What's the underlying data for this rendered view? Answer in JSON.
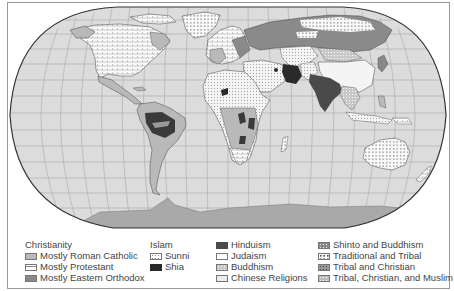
{
  "map": {
    "title": "World Religions",
    "projection": "Robinson-style oval world map with graticule",
    "colors": {
      "ocean": "#dcdcdc",
      "graticule": "#a8a8a8",
      "outline": "#333333",
      "antarctica": "#a9a9a9"
    }
  },
  "legend": {
    "groups": [
      {
        "title": "Christianity",
        "items": [
          {
            "label": "Mostly Roman Catholic",
            "swatch": "catholic",
            "color": "#b9b9b9"
          },
          {
            "label": "Mostly Protestant",
            "swatch": "protestant",
            "color": "#ffffff"
          },
          {
            "label": "Mostly Eastern Orthodox",
            "swatch": "orthodox",
            "color": "#8a8a8a"
          }
        ]
      },
      {
        "title": "Islam",
        "items": [
          {
            "label": "Sunni",
            "swatch": "sunni",
            "color": "#ffffff"
          },
          {
            "label": "Shia",
            "swatch": "shia",
            "color": "#2a2a2a"
          }
        ]
      },
      {
        "title": "",
        "items": [
          {
            "label": "Hinduism",
            "swatch": "hindu",
            "color": "#4a4a4a"
          },
          {
            "label": "Judaism",
            "swatch": "judaism",
            "color": "#ffffff"
          },
          {
            "label": "Buddhism",
            "swatch": "buddhism",
            "color": "#c8c8c8"
          },
          {
            "label": "Chinese Religions",
            "swatch": "chinese",
            "color": "#ececec"
          }
        ]
      },
      {
        "title": "",
        "items": [
          {
            "label": "Shinto and Buddhism",
            "swatch": "shinto",
            "color": "#888888"
          },
          {
            "label": "Traditional and Tribal",
            "swatch": "tribal",
            "color": "#ffffff"
          },
          {
            "label": "Tribal and Christian",
            "swatch": "tribchrist",
            "color": "#9a9a9a"
          },
          {
            "label": "Tribal, Christian, and Muslim",
            "swatch": "tribchristmus",
            "color": "#bbbbbb"
          }
        ]
      }
    ]
  }
}
